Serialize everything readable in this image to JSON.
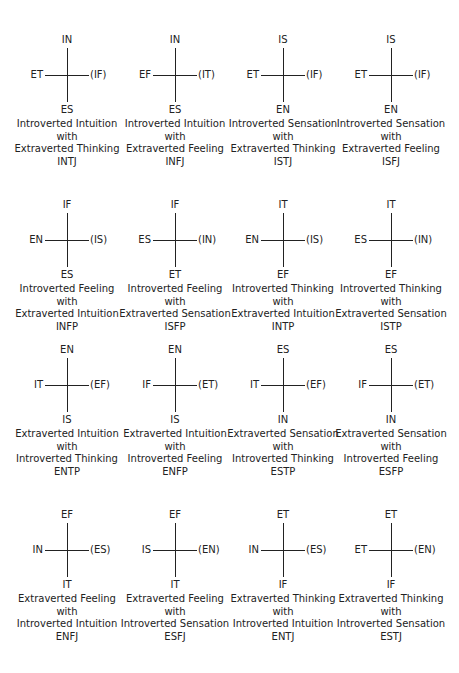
{
  "diagrams": [
    {
      "top": "IN",
      "left": "ET",
      "right": "(IF)",
      "bottom": "ES",
      "dominant": "Introverted Intuition",
      "with": "with",
      "auxiliary": "Extraverted Thinking",
      "type": "INTJ"
    },
    {
      "top": "IN",
      "left": "EF",
      "right": "(IT)",
      "bottom": "ES",
      "dominant": "Introverted Intuition",
      "with": "with",
      "auxiliary": "Extraverted Feeling",
      "type": "INFJ"
    },
    {
      "top": "IS",
      "left": "ET",
      "right": "(IF)",
      "bottom": "EN",
      "dominant": "Introverted Sensation",
      "with": "with",
      "auxiliary": "Extraverted Thinking",
      "type": "ISTJ"
    },
    {
      "top": "IS",
      "left": "ET",
      "right": "(IF)",
      "bottom": "EN",
      "dominant": "Introverted Sensation",
      "with": "with",
      "auxiliary": "Extraverted Feeling",
      "type": "ISFJ"
    },
    {
      "top": "IF",
      "left": "EN",
      "right": "(IS)",
      "bottom": "ES",
      "dominant": "Introverted Feeling",
      "with": "with",
      "auxiliary": "Extraverted Intuition",
      "type": "INFP"
    },
    {
      "top": "IF",
      "left": "ES",
      "right": "(IN)",
      "bottom": "ET",
      "dominant": "Introverted Feeling",
      "with": "with",
      "auxiliary": "Extraverted Sensation",
      "type": "ISFP"
    },
    {
      "top": "IT",
      "left": "EN",
      "right": "(IS)",
      "bottom": "EF",
      "dominant": "Introverted Thinking",
      "with": "with",
      "auxiliary": "Extraverted Intuition",
      "type": "INTP"
    },
    {
      "top": "IT",
      "left": "ES",
      "right": "(IN)",
      "bottom": "EF",
      "dominant": "Introverted Thinking",
      "with": "with",
      "auxiliary": "Extraverted Sensation",
      "type": "ISTP"
    },
    {
      "top": "EN",
      "left": "IT",
      "right": "(EF)",
      "bottom": "IS",
      "dominant": "Extraverted Intuition",
      "with": "with",
      "auxiliary": "Introverted Thinking",
      "type": "ENTP"
    },
    {
      "top": "EN",
      "left": "IF",
      "right": "(ET)",
      "bottom": "IS",
      "dominant": "Extraverted Intuition",
      "with": "with",
      "auxiliary": "Introverted Feeling",
      "type": "ENFP"
    },
    {
      "top": "ES",
      "left": "IT",
      "right": "(EF)",
      "bottom": "IN",
      "dominant": "Extraverted Sensation",
      "with": "with",
      "auxiliary": "Introverted Thinking",
      "type": "ESTP"
    },
    {
      "top": "ES",
      "left": "IF",
      "right": "(ET)",
      "bottom": "IN",
      "dominant": "Extraverted Sensation",
      "with": "with",
      "auxiliary": "Introverted Feeling",
      "type": "ESFP"
    },
    {
      "top": "EF",
      "left": "IN",
      "right": "(ES)",
      "bottom": "IT",
      "dominant": "Extraverted Feeling",
      "with": "with",
      "auxiliary": "Introverted Intuition",
      "type": "ENFJ"
    },
    {
      "top": "EF",
      "left": "IS",
      "right": "(EN)",
      "bottom": "IT",
      "dominant": "Extraverted Feeling",
      "with": "with",
      "auxiliary": "Introverted Sensation",
      "type": "ESFJ"
    },
    {
      "top": "ET",
      "left": "IN",
      "right": "(ES)",
      "bottom": "IF",
      "dominant": "Extraverted Thinking",
      "with": "with",
      "auxiliary": "Introverted Intuition",
      "type": "ENTJ"
    },
    {
      "top": "ET",
      "left": "ET",
      "right": "(EN)",
      "bottom": "IF",
      "dominant": "Extraverted Thinking",
      "with": "with",
      "auxiliary": "Introverted Sensation",
      "type": "ESTJ"
    }
  ]
}
